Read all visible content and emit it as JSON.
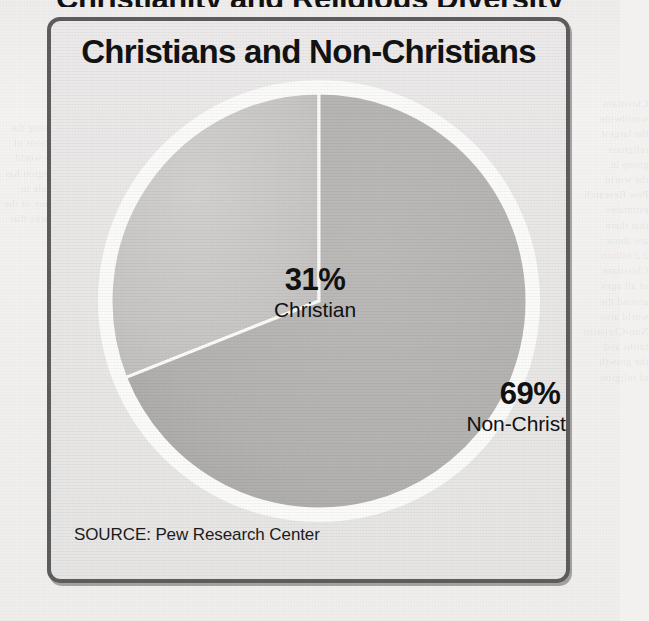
{
  "page": {
    "clipped_headline_above_frame": "Christianity and Religious Diversity",
    "bleed_through_right": "Christians\nworldwide\nthe largest\nreligious\ngroup in\nthe world\nPew Research\nestimates\nthat there\nare about\n2.2 billion\nChristians\nof all ages\naround the\nworld also\nNon-Christian\nfaiths and\nthe growth\nof religion",
    "bleed_through_left": "among the\nnations of\nthe world\nreligion has\na role in\nmany of the\nplaces that"
  },
  "chart_panel": {
    "title": "Christians and Non-Christians",
    "source": "SOURCE: Pew Research Center",
    "border_color": "#5d5d5d",
    "background_color": "#e9e8e7"
  },
  "chart_data": {
    "type": "pie",
    "title": "Christians and Non-Christians",
    "categories": [
      "Christian",
      "Non-Christian"
    ],
    "values": [
      31,
      69
    ],
    "value_labels": [
      "31%",
      "69%"
    ],
    "unit": "percent",
    "start_angle_deg": 0,
    "direction": "counterclockwise",
    "colors": [
      "#c8c7c6",
      "#b3b2b1"
    ],
    "slice_outline_color": "#ffffff",
    "legend": "none",
    "grid": false,
    "source": "SOURCE: Pew Research Center",
    "slices": [
      {
        "label": "Christian",
        "value": 31,
        "display": "31%",
        "color": "#c8c7c6"
      },
      {
        "label": "Non-Christian",
        "value": 69,
        "display": "69%",
        "color": "#b3b2b1"
      }
    ]
  }
}
